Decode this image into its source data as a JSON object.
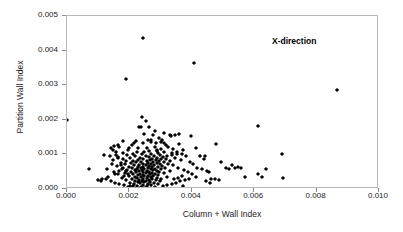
{
  "chart_data": {
    "type": "scatter",
    "title": "",
    "xlabel": "Column + Wall Index",
    "ylabel": "Partition Wall Index",
    "xlim": [
      0.0,
      0.01
    ],
    "ylim": [
      0.0,
      0.005
    ],
    "xticks": [
      "0.000",
      "0.002",
      "0.004",
      "0.006",
      "0.008",
      "0.010"
    ],
    "xtick_values": [
      0.0,
      0.002,
      0.004,
      0.006,
      0.008,
      0.01
    ],
    "yticks": [
      "0.000",
      "0.001",
      "0.002",
      "0.003",
      "0.004",
      "0.005"
    ],
    "ytick_values": [
      0.0,
      0.001,
      0.002,
      0.003,
      0.004,
      0.005
    ],
    "grid": false,
    "legend": null,
    "annotations": [
      {
        "text": "X-direction",
        "x": 0.0066,
        "y": 0.00438,
        "bold": true
      }
    ],
    "marker": {
      "shape": "diamond",
      "color": "#000000",
      "size_px": 3
    },
    "series": [
      {
        "name": "X-direction",
        "points": [
          [
            0.0,
            0.002
          ],
          [
            0.00245,
            0.00437
          ],
          [
            0.00188,
            0.00319
          ],
          [
            0.00408,
            0.00365
          ],
          [
            0.00865,
            0.00285
          ],
          [
            0.0024,
            0.00208
          ],
          [
            0.00252,
            0.00196
          ],
          [
            0.00237,
            0.0018
          ],
          [
            0.00232,
            0.00178
          ],
          [
            0.00262,
            0.00178
          ],
          [
            0.00613,
            0.00183
          ],
          [
            0.0069,
            0.001
          ],
          [
            0.0031,
            0.00162
          ],
          [
            0.00275,
            0.00157
          ],
          [
            0.0033,
            0.00155
          ],
          [
            0.00345,
            0.00156
          ],
          [
            0.00358,
            0.00158
          ],
          [
            0.00398,
            0.00153
          ],
          [
            0.00333,
            0.00152
          ],
          [
            0.00295,
            0.00148
          ],
          [
            0.00258,
            0.00143
          ],
          [
            0.00305,
            0.00142
          ],
          [
            0.00222,
            0.0014
          ],
          [
            0.00478,
            0.00131
          ],
          [
            0.00268,
            0.00136
          ],
          [
            0.00285,
            0.00133
          ],
          [
            0.00243,
            0.00132
          ],
          [
            0.0036,
            0.0013
          ],
          [
            0.00318,
            0.00128
          ],
          [
            0.00207,
            0.00126
          ],
          [
            0.0015,
            0.00124
          ],
          [
            0.00168,
            0.0012
          ],
          [
            0.00283,
            0.00122
          ],
          [
            0.00255,
            0.00119
          ],
          [
            0.00228,
            0.00118
          ],
          [
            0.003,
            0.00117
          ],
          [
            0.0034,
            0.00115
          ],
          [
            0.00372,
            0.00113
          ],
          [
            0.00195,
            0.00112
          ],
          [
            0.00263,
            0.0011
          ],
          [
            0.00288,
            0.00109
          ],
          [
            0.00225,
            0.00108
          ],
          [
            0.00312,
            0.00107
          ],
          [
            0.00248,
            0.00106
          ],
          [
            0.00178,
            0.00105
          ],
          [
            0.00335,
            0.00104
          ],
          [
            0.00292,
            0.00103
          ],
          [
            0.00212,
            0.00102
          ],
          [
            0.00268,
            0.00101
          ],
          [
            0.0024,
            0.001
          ],
          [
            0.00352,
            0.001
          ],
          [
            0.00158,
            0.00098
          ],
          [
            0.00298,
            0.00098
          ],
          [
            0.00192,
            0.00097
          ],
          [
            0.00322,
            0.00096
          ],
          [
            0.00252,
            0.00096
          ],
          [
            0.00278,
            0.00095
          ],
          [
            0.00382,
            0.00095
          ],
          [
            0.00218,
            0.00094
          ],
          [
            0.00442,
            0.00094
          ],
          [
            0.00308,
            0.00093
          ],
          [
            0.00165,
            0.00092
          ],
          [
            0.00262,
            0.00092
          ],
          [
            0.00235,
            0.00091
          ],
          [
            0.0029,
            0.0009
          ],
          [
            0.00345,
            0.0009
          ],
          [
            0.00202,
            0.00089
          ],
          [
            0.00272,
            0.00088
          ],
          [
            0.00318,
            0.00088
          ],
          [
            0.0018,
            0.00087
          ],
          [
            0.00245,
            0.00086
          ],
          [
            0.00302,
            0.00086
          ],
          [
            0.00228,
            0.00085
          ],
          [
            0.00265,
            0.00084
          ],
          [
            0.00365,
            0.00084
          ],
          [
            0.00148,
            0.00083
          ],
          [
            0.00285,
            0.00083
          ],
          [
            0.0021,
            0.00082
          ],
          [
            0.0033,
            0.00082
          ],
          [
            0.00255,
            0.00081
          ],
          [
            0.0019,
            0.0008
          ],
          [
            0.00295,
            0.0008
          ],
          [
            0.00238,
            0.00079
          ],
          [
            0.00275,
            0.00078
          ],
          [
            0.00395,
            0.00078
          ],
          [
            0.00222,
            0.00077
          ],
          [
            0.0031,
            0.00077
          ],
          [
            0.00172,
            0.00076
          ],
          [
            0.0026,
            0.00075
          ],
          [
            0.00288,
            0.00075
          ],
          [
            0.00205,
            0.00074
          ],
          [
            0.00242,
            0.00073
          ],
          [
            0.00325,
            0.00073
          ],
          [
            0.00268,
            0.00072
          ],
          [
            0.00185,
            0.00071
          ],
          [
            0.00298,
            0.00071
          ],
          [
            0.00232,
            0.0007
          ],
          [
            0.00252,
            0.00069
          ],
          [
            0.0028,
            0.00069
          ],
          [
            0.0034,
            0.00068
          ],
          [
            0.00215,
            0.00068
          ],
          [
            0.00262,
            0.00067
          ],
          [
            0.0016,
            0.00066
          ],
          [
            0.00305,
            0.00066
          ],
          [
            0.00245,
            0.00065
          ],
          [
            0.00198,
            0.00064
          ],
          [
            0.00272,
            0.00064
          ],
          [
            0.00228,
            0.00063
          ],
          [
            0.00292,
            0.00063
          ],
          [
            0.00355,
            0.00062
          ],
          [
            0.00238,
            0.00062
          ],
          [
            0.00178,
            0.00061
          ],
          [
            0.00258,
            0.00061
          ],
          [
            0.00315,
            0.0006
          ],
          [
            0.00208,
            0.0006
          ],
          [
            0.00282,
            0.00059
          ],
          [
            0.00248,
            0.00058
          ],
          [
            0.00225,
            0.00058
          ],
          [
            0.00268,
            0.00057
          ],
          [
            0.003,
            0.00057
          ],
          [
            0.00192,
            0.00056
          ],
          [
            0.0024,
            0.00055
          ],
          [
            0.00275,
            0.00055
          ],
          [
            0.00218,
            0.00054
          ],
          [
            0.00255,
            0.00053
          ],
          [
            0.00288,
            0.00053
          ],
          [
            0.0033,
            0.00052
          ],
          [
            0.00168,
            0.00052
          ],
          [
            0.00232,
            0.00051
          ],
          [
            0.00262,
            0.0005
          ],
          [
            0.00205,
            0.0005
          ],
          [
            0.00295,
            0.00049
          ],
          [
            0.00245,
            0.00048
          ],
          [
            0.00222,
            0.00048
          ],
          [
            0.00272,
            0.00047
          ],
          [
            0.00185,
            0.00046
          ],
          [
            0.00252,
            0.00046
          ],
          [
            0.0031,
            0.00045
          ],
          [
            0.00235,
            0.00044
          ],
          [
            0.00282,
            0.00044
          ],
          [
            0.00212,
            0.00043
          ],
          [
            0.00265,
            0.00042
          ],
          [
            0.00155,
            0.00042
          ],
          [
            0.00242,
            0.00041
          ],
          [
            0.00292,
            0.00041
          ],
          [
            0.00228,
            0.0004
          ],
          [
            0.00258,
            0.00039
          ],
          [
            0.00198,
            0.00038
          ],
          [
            0.00275,
            0.00038
          ],
          [
            0.00248,
            0.00037
          ],
          [
            0.0032,
            0.00036
          ],
          [
            0.00218,
            0.00036
          ],
          [
            0.00268,
            0.00035
          ],
          [
            0.00238,
            0.00034
          ],
          [
            0.00288,
            0.00033
          ],
          [
            0.00175,
            0.00033
          ],
          [
            0.00255,
            0.00032
          ],
          [
            0.00225,
            0.00031
          ],
          [
            0.00302,
            0.0003
          ],
          [
            0.00245,
            0.0003
          ],
          [
            0.00208,
            0.00029
          ],
          [
            0.00272,
            0.00028
          ],
          [
            0.00232,
            0.00027
          ],
          [
            0.00262,
            0.00026
          ],
          [
            0.0019,
            0.00026
          ],
          [
            0.00285,
            0.00025
          ],
          [
            0.00252,
            0.00024
          ],
          [
            0.00218,
            0.00023
          ],
          [
            0.0024,
            0.00022
          ],
          [
            0.00298,
            0.00022
          ],
          [
            0.00265,
            0.00021
          ],
          [
            0.00228,
            0.0002
          ],
          [
            0.00248,
            0.00019
          ],
          [
            0.00202,
            0.00018
          ],
          [
            0.00278,
            0.00017
          ],
          [
            0.00235,
            0.00016
          ],
          [
            0.00258,
            0.00015
          ],
          [
            0.00215,
            0.00014
          ],
          [
            0.00292,
            0.00014
          ],
          [
            0.00245,
            0.00012
          ],
          [
            0.00268,
            0.00011
          ],
          [
            0.00225,
            0.0001
          ],
          [
            0.00255,
            8e-05
          ],
          [
            0.00238,
            6e-05
          ],
          [
            0.00282,
            5e-05
          ],
          [
            0.0025,
            3e-05
          ],
          [
            0.00072,
            0.00058
          ],
          [
            0.00098,
            0.00026
          ],
          [
            0.00112,
            0.00028
          ],
          [
            0.00125,
            0.0003
          ],
          [
            0.00108,
            0.00024
          ],
          [
            0.00142,
            0.00022
          ],
          [
            0.00132,
            0.00035
          ],
          [
            0.00155,
            0.00018
          ],
          [
            0.00118,
            0.00098
          ],
          [
            0.00138,
            0.00095
          ],
          [
            0.00162,
            0.0009
          ],
          [
            0.00145,
            0.00072
          ],
          [
            0.00172,
            0.00068
          ],
          [
            0.00128,
            0.00058
          ],
          [
            0.00152,
            0.00048
          ],
          [
            0.00165,
            0.00042
          ],
          [
            0.00182,
            0.00038
          ],
          [
            0.00148,
            0.00112
          ],
          [
            0.00158,
            0.00106
          ],
          [
            0.00175,
            0.00058
          ],
          [
            0.00188,
            0.00052
          ],
          [
            0.00195,
            0.00044
          ],
          [
            0.00168,
            0.00015
          ],
          [
            0.00182,
            0.00012
          ],
          [
            0.00202,
            0.0001
          ],
          [
            0.00212,
            8e-05
          ],
          [
            0.00195,
            5e-05
          ],
          [
            0.00412,
            0.00118
          ],
          [
            0.00425,
            0.00095
          ],
          [
            0.00438,
            0.00088
          ],
          [
            0.00405,
            0.00072
          ],
          [
            0.00418,
            0.00062
          ],
          [
            0.00432,
            0.00058
          ],
          [
            0.00448,
            0.00052
          ],
          [
            0.00455,
            0.00048
          ],
          [
            0.00462,
            0.0003
          ],
          [
            0.00475,
            0.00028
          ],
          [
            0.00488,
            0.00026
          ],
          [
            0.00445,
            0.00022
          ],
          [
            0.00458,
            0.00018
          ],
          [
            0.00402,
            0.00042
          ],
          [
            0.00415,
            0.00035
          ],
          [
            0.00388,
            0.00048
          ],
          [
            0.00375,
            0.00055
          ],
          [
            0.00368,
            0.00038
          ],
          [
            0.00392,
            0.00028
          ],
          [
            0.00378,
            0.00025
          ],
          [
            0.00355,
            0.00032
          ],
          [
            0.00342,
            0.00028
          ],
          [
            0.00362,
            0.00022
          ],
          [
            0.00348,
            0.00018
          ],
          [
            0.00335,
            0.00015
          ],
          [
            0.00322,
            0.00012
          ],
          [
            0.00308,
            0.0001
          ],
          [
            0.00372,
            0.0001
          ],
          [
            0.00495,
            0.00078
          ],
          [
            0.00508,
            0.00062
          ],
          [
            0.00518,
            0.00058
          ],
          [
            0.00528,
            0.00068
          ],
          [
            0.00538,
            0.00062
          ],
          [
            0.00548,
            0.00065
          ],
          [
            0.00558,
            0.00062
          ],
          [
            0.00572,
            0.00035
          ],
          [
            0.00525,
            0.0
          ],
          [
            0.00612,
            0.00042
          ],
          [
            0.00625,
            0.00035
          ],
          [
            0.00638,
            0.00058
          ],
          [
            0.00692,
            0.00032
          ],
          [
            0.00282,
            0.00168
          ],
          [
            0.00268,
            0.00142
          ],
          [
            0.00248,
            0.0016
          ],
          [
            0.00215,
            0.00132
          ],
          [
            0.00198,
            0.00118
          ],
          [
            0.00178,
            0.00138
          ],
          [
            0.00162,
            0.00128
          ],
          [
            0.0014,
            0.00118
          ],
          [
            0.00302,
            0.00136
          ],
          [
            0.00325,
            0.00122
          ],
          [
            0.00288,
            0.00112
          ],
          [
            0.00352,
            0.00108
          ],
          [
            0.00368,
            0.00102
          ],
          [
            0.00338,
            0.00098
          ],
          [
            0.00312,
            0.00132
          ]
        ]
      }
    ]
  },
  "axis": {
    "x_title": "Column + Wall Index",
    "y_title": "Partition Wall Index"
  }
}
